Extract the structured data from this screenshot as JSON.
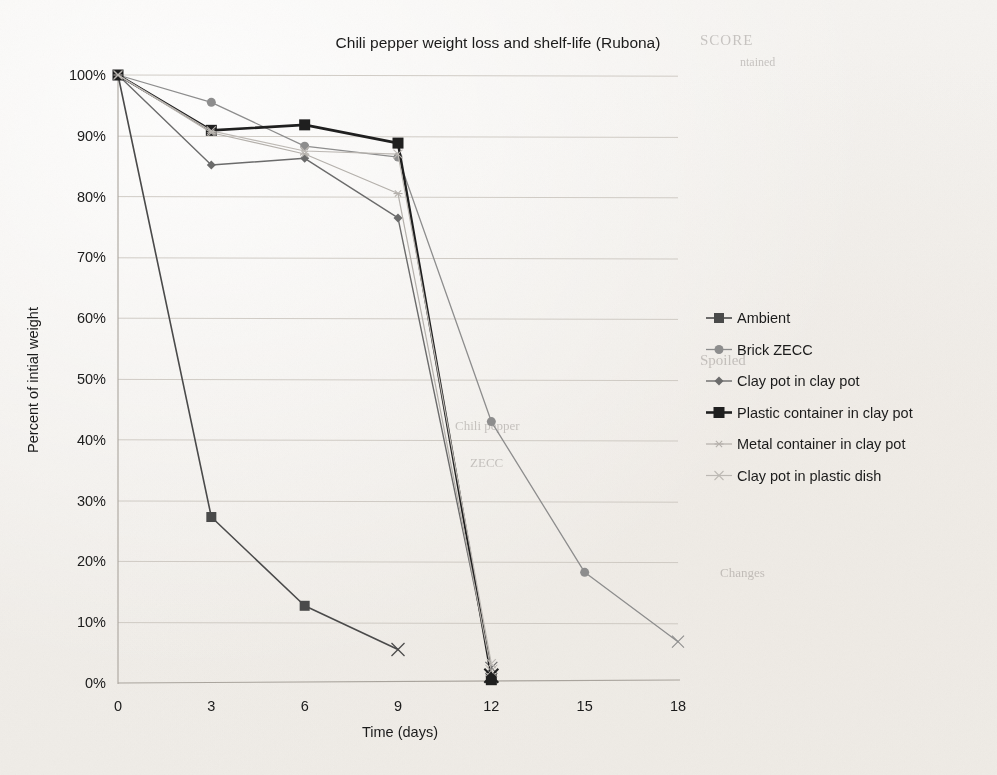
{
  "chart_data": {
    "type": "line",
    "title": "Chili pepper weight loss and shelf-life (Rubona)",
    "xlabel": "Time (days)",
    "ylabel": "Percent of intial weight",
    "x": [
      0,
      3,
      6,
      9,
      12,
      15,
      18
    ],
    "xticks": [
      "0",
      "3",
      "6",
      "9",
      "12",
      "15",
      "18"
    ],
    "yticks": [
      "0%",
      "10%",
      "20%",
      "30%",
      "40%",
      "50%",
      "60%",
      "70%",
      "80%",
      "90%",
      "100%"
    ],
    "xlim": [
      0,
      18
    ],
    "ylim": [
      0,
      100
    ],
    "grid": true,
    "legend_position": "right",
    "series": [
      {
        "name": "Ambient",
        "color": "#4a4a4a",
        "marker": "square",
        "marker_size": 5,
        "line_width": 1.6,
        "x": [
          0,
          3,
          6,
          9
        ],
        "values": [
          100,
          27.3,
          12.7,
          5.5
        ],
        "end_marker": "x"
      },
      {
        "name": "Brick ZECC",
        "color": "#8d8d8d",
        "marker": "circle",
        "marker_size": 4.5,
        "line_width": 1.3,
        "x": [
          0,
          3,
          6,
          9,
          12,
          15,
          18
        ],
        "values": [
          100,
          95.5,
          88.3,
          86.5,
          43.0,
          18.2,
          6.8
        ],
        "end_marker": "x"
      },
      {
        "name": "Clay pot in clay pot",
        "color": "#6b6b6b",
        "marker": "diamond",
        "marker_size": 4.5,
        "line_width": 1.4,
        "x": [
          0,
          3,
          6,
          9,
          12
        ],
        "values": [
          100,
          85.2,
          86.3,
          76.5,
          2.5
        ],
        "end_marker": "x"
      },
      {
        "name": "Plastic container in clay pot",
        "color": "#1f1f1f",
        "marker": "square",
        "marker_size": 5.5,
        "line_width": 2.6,
        "x": [
          0,
          3,
          6,
          9,
          12
        ],
        "values": [
          100,
          90.9,
          91.8,
          88.8,
          1.2
        ],
        "end_marker": "x"
      },
      {
        "name": "Metal container in clay pot",
        "color": "#b4b0ab",
        "marker": "star",
        "marker_size": 4.5,
        "line_width": 1.2,
        "x": [
          0,
          3,
          6,
          9,
          12
        ],
        "values": [
          100,
          90.5,
          87.0,
          80.5,
          2.0
        ],
        "end_marker": "x"
      },
      {
        "name": "Clay pot in plastic dish",
        "color": "#bdb9b4",
        "marker": "x",
        "marker_size": 4.5,
        "line_width": 1.2,
        "x": [
          0,
          3,
          6,
          9,
          12
        ],
        "values": [
          100,
          90.8,
          87.5,
          87.0,
          3.2
        ],
        "end_marker": "x"
      }
    ]
  },
  "ghost_text": {
    "top_right": "SCORE",
    "mid_right_1": "ntained",
    "mid_right_2": "Spoiled",
    "mid_right_3": "Chili pepper",
    "mid_right_4": "ZECC",
    "mid_right_5": "Changes"
  }
}
